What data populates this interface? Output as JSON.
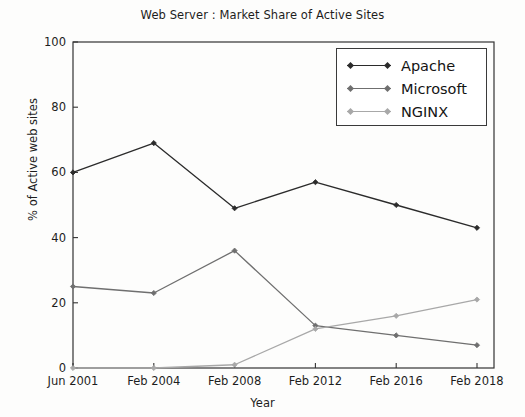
{
  "chart_data": {
    "type": "line",
    "title": "Web Server : Market Share of Active Sites",
    "xlabel": "Year",
    "ylabel": "% of Active web sites",
    "categories": [
      "Jun 2001",
      "Feb 2004",
      "Feb 2008",
      "Feb 2012",
      "Feb 2016",
      "Feb 2018"
    ],
    "xticklabels": [
      "Jun 2001",
      "Feb 2004",
      "Feb 2008",
      "Feb 2012",
      "Feb 2016",
      "Feb 2018"
    ],
    "yticklabels": [
      "0",
      "20",
      "40",
      "60",
      "80",
      "100"
    ],
    "yticks": [
      0,
      20,
      40,
      60,
      80,
      100
    ],
    "ylim": [
      0,
      100
    ],
    "grid": false,
    "legend_position": "upper right",
    "series": [
      {
        "name": "Apache",
        "color": "#2b2b2b",
        "marker": "diamond",
        "values": [
          60,
          69,
          49,
          57,
          50,
          43
        ]
      },
      {
        "name": "Microsoft",
        "color": "#6f6f6f",
        "marker": "diamond",
        "values": [
          25,
          23,
          36,
          13,
          10,
          7
        ]
      },
      {
        "name": "NGINX",
        "color": "#a8a8a8",
        "marker": "diamond",
        "values": [
          0,
          0,
          1,
          12,
          16,
          21
        ]
      }
    ]
  },
  "legend": {
    "items": [
      {
        "label": "Apache",
        "color": "#2b2b2b"
      },
      {
        "label": "Microsoft",
        "color": "#6f6f6f"
      },
      {
        "label": "NGINX",
        "color": "#a8a8a8"
      }
    ]
  }
}
